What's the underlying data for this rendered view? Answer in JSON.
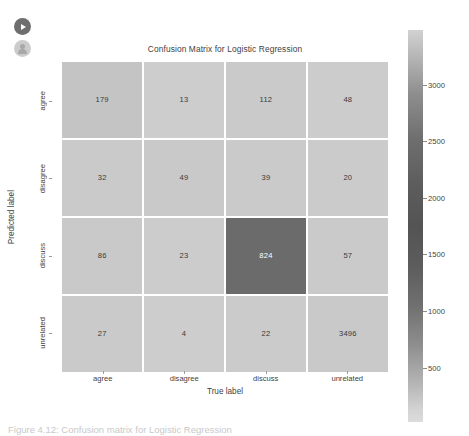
{
  "overlay_icons": [
    {
      "name": "play-icon",
      "label": "Play"
    },
    {
      "name": "account-icon",
      "label": "Account"
    }
  ],
  "figure": {
    "title": "Confusion Matrix for Logistic Regression",
    "xlabel": "True label",
    "ylabel": "Predicted label",
    "caption": "Figure 4.12: Confusion matrix for Logistic Regression"
  },
  "colorbar": {
    "ticks": [
      "3000",
      "2500",
      "2000",
      "1500",
      "1000",
      "500"
    ],
    "tick_positions_px": [
      85,
      141,
      198,
      254,
      311,
      368
    ],
    "min": 0,
    "max": 3496
  },
  "chart_data": {
    "type": "heatmap",
    "title": "Confusion Matrix for Logistic Regression",
    "xlabel": "True label",
    "ylabel": "Predicted label",
    "x_categories": [
      "agree",
      "disagree",
      "discuss",
      "unrelated"
    ],
    "y_categories": [
      "agree",
      "disagree",
      "discuss",
      "unrelated"
    ],
    "values": [
      [
        179,
        13,
        112,
        48
      ],
      [
        32,
        49,
        39,
        20
      ],
      [
        86,
        23,
        824,
        57
      ],
      [
        27,
        4,
        22,
        3496
      ]
    ],
    "cell_colors": [
      [
        "#c4c4c4",
        "#cdcdcd",
        "#cacaca",
        "#cccccc"
      ],
      [
        "#cacaca",
        "#c9c9c9",
        "#cacaca",
        "#cbcbcb"
      ],
      [
        "#c9c9c9",
        "#cccccc",
        "#6b6b6b",
        "#cacaca"
      ],
      [
        "#cacaca",
        "#cdcdcd",
        "#cbcbcb",
        "#c9c9c9"
      ]
    ],
    "cell_text_colors": [
      [
        "#3a3a3a",
        "#3a3a3a",
        "#3a3a3a",
        "#3a3a3a"
      ],
      [
        "#3a3a3a",
        "#3a3a3a",
        "#3a3a3a",
        "#3a3a3a"
      ],
      [
        "#3a3a3a",
        "#3a3a3a",
        "#ffffff",
        "#3a3a3a"
      ],
      [
        "#3a3a3a",
        "#3a3a3a",
        "#3a3a3a",
        "#3a3a3a"
      ]
    ],
    "colormap": "greys",
    "grid": false,
    "legend": "colorbar-right"
  }
}
